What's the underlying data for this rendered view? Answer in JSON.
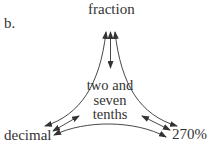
{
  "label": "b.",
  "nodes": {
    "top": "fraction",
    "left": "decimal",
    "right": "270%",
    "center": [
      "two and",
      "seven",
      "tenths"
    ]
  },
  "edges": [
    {
      "from": "fraction",
      "to": "decimal",
      "type": "double-arrow"
    },
    {
      "from": "fraction",
      "to": "270%",
      "type": "double-arrow"
    },
    {
      "from": "fraction",
      "to": "two and seven tenths",
      "type": "double-arrow"
    },
    {
      "from": "decimal",
      "to": "two and seven tenths",
      "type": "double-arrow"
    },
    {
      "from": "270%",
      "to": "two and seven tenths",
      "type": "double-arrow"
    },
    {
      "from": "decimal",
      "to": "270%",
      "type": "double-arrow"
    }
  ]
}
